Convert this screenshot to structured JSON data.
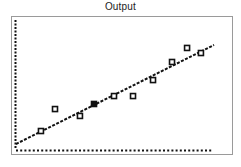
{
  "chart_data": {
    "type": "scatter",
    "title": "Output",
    "xlabel": "",
    "ylabel": "",
    "note": "No axis tick labels or numeric values are shown in the image. Point coordinates are approximate pixel positions normalized to a 0-100 scale over the plot area, not real data values.",
    "units": "normalized pixel position (0-100), not data units",
    "xlim": [
      0,
      100
    ],
    "ylim": [
      0,
      100
    ],
    "grid": false,
    "legend": null,
    "axes": {
      "x_axis_style": "dotted",
      "y_axis_style": "dotted",
      "tick_labels": false
    },
    "series": [
      {
        "name": "observations",
        "marker": "hollow-square",
        "points": [
          {
            "x": 12.6,
            "y": 14.6
          },
          {
            "x": 19.7,
            "y": 31.5
          },
          {
            "x": 32.3,
            "y": 26.2
          },
          {
            "x": 39.4,
            "y": 35.4,
            "filled": true
          },
          {
            "x": 49.5,
            "y": 41.5
          },
          {
            "x": 59.1,
            "y": 41.5
          },
          {
            "x": 69.2,
            "y": 53.8
          },
          {
            "x": 78.8,
            "y": 67.7
          },
          {
            "x": 86.4,
            "y": 78.5
          },
          {
            "x": 93.4,
            "y": 74.6
          }
        ]
      },
      {
        "name": "fit-line",
        "style": "dashed",
        "points": [
          {
            "x": 0.0,
            "y": 4.6
          },
          {
            "x": 100.0,
            "y": 80.8
          }
        ]
      }
    ]
  },
  "layout": {
    "plot_px": {
      "x0": 16,
      "x1": 214,
      "y_bottom": 150,
      "y_top": 20
    },
    "frame_px": {
      "left": 11,
      "top": 16,
      "right": 234,
      "bottom": 156
    }
  },
  "colors": {
    "ink": "#111111",
    "frame": "#9a9a9a",
    "background": "#ffffff",
    "title": "#222222"
  }
}
